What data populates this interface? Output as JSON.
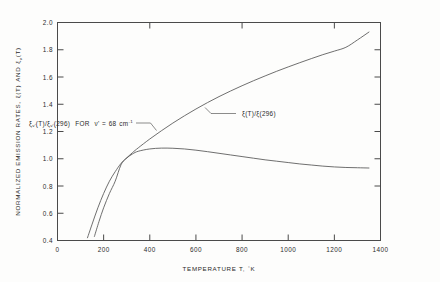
{
  "figure": {
    "background_color": "#fdfdfc",
    "axis_color": "#4a4a4a",
    "curve_color": "#555555"
  },
  "chart_data": {
    "type": "line",
    "title": "",
    "xlabel": "TEMPERATURE T, °K",
    "ylabel": "NORMALIZED EMISSION RATES, ξ(T) AND ξᵥ(T)",
    "xlim": [
      0,
      1400
    ],
    "ylim": [
      0.4,
      2.0
    ],
    "xticks": [
      0,
      200,
      400,
      600,
      800,
      1000,
      1200,
      1400
    ],
    "xticklabels": [
      "0",
      "200",
      "400",
      "600",
      "800",
      "1000",
      "1200",
      "1400"
    ],
    "yticks": [
      0.4,
      0.6,
      0.8,
      1.0,
      1.2,
      1.4,
      1.6,
      1.8,
      2.0
    ],
    "yticklabels": [
      "0.4",
      "0.6",
      "0.8",
      "1.0",
      "1.2",
      "1.4",
      "1.6",
      "1.8",
      "2.0"
    ],
    "grid": false,
    "legend_position": "inline-annotations",
    "series": [
      {
        "name": "xi_total",
        "label_plain": "ξ(T)/ξ(296)",
        "label_parts": {
          "symbol": "ξ",
          "numerator": "(T)",
          "slash": "/",
          "denom_symbol": "ξ",
          "denom": "(296)"
        },
        "x": [
          130,
          150,
          175,
          200,
          225,
          250,
          275,
          296,
          325,
          350,
          400,
          450,
          500,
          550,
          600,
          650,
          700,
          750,
          800,
          850,
          900,
          950,
          1000,
          1050,
          1100,
          1150,
          1200,
          1250,
          1300,
          1350
        ],
        "y": [
          0.42,
          0.52,
          0.64,
          0.745,
          0.835,
          0.905,
          0.965,
          1.0,
          1.045,
          1.08,
          1.145,
          1.205,
          1.262,
          1.315,
          1.365,
          1.412,
          1.456,
          1.497,
          1.536,
          1.573,
          1.608,
          1.642,
          1.674,
          1.705,
          1.735,
          1.764,
          1.79,
          1.818,
          1.872,
          1.93
        ]
      },
      {
        "name": "xi_nu",
        "label_plain": "ξᵥ(T)/ξᵥ(296) FOR ν' = 68 cm⁻¹",
        "label_parts": {
          "symbol": "ξ",
          "sub": "ν'",
          "numerator": "(T)",
          "slash": "/",
          "denom_symbol": "ξ",
          "denom_sub": "ν'",
          "denom": "(296)",
          "for_text": "FOR",
          "nu_symbol": "ν'",
          "equals": "=",
          "value": "68",
          "unit": "cm",
          "unit_exp": "-1"
        },
        "x": [
          160,
          180,
          200,
          225,
          250,
          275,
          296,
          325,
          350,
          400,
          450,
          500,
          550,
          600,
          650,
          700,
          750,
          800,
          850,
          900,
          950,
          1000,
          1050,
          1100,
          1150,
          1200,
          1250,
          1300,
          1350
        ],
        "y": [
          0.43,
          0.54,
          0.64,
          0.745,
          0.835,
          0.955,
          1.0,
          1.035,
          1.055,
          1.072,
          1.078,
          1.077,
          1.072,
          1.063,
          1.052,
          1.04,
          1.028,
          1.016,
          1.004,
          0.992,
          0.982,
          0.972,
          0.962,
          0.954,
          0.946,
          0.94,
          0.936,
          0.934,
          0.932
        ]
      }
    ],
    "annotations": [
      {
        "name": "xi-total-annotation",
        "text": "ξ(T)/ξ(296)",
        "anchor_point": [
          640,
          1.43
        ],
        "label_point": [
          770,
          1.585
        ]
      },
      {
        "name": "xi-nu-annotation",
        "text": "ξᵥ(T)/ξᵥ(296)   FOR   ν' = 68 cm⁻¹",
        "anchor_point": [
          430,
          1.08
        ],
        "label_point": [
          345,
          1.235
        ]
      }
    ]
  },
  "axes": {
    "x_title": "TEMPERATURE T, °K",
    "x_title_main": "TEMPERATURE T,",
    "x_title_deg": "°",
    "x_title_k": "K",
    "y_title": "NORMALIZED EMISSION RATES, ξ(T) AND ξᵥ(T)",
    "y_title_pre": "NORMALIZED EMISSION RATES,",
    "y_title_sym1": "ξ",
    "y_title_arg1": "(T)",
    "y_title_and": "AND",
    "y_title_sym2": "ξ",
    "y_title_sub2": "ν",
    "y_title_arg2": "(T)"
  }
}
